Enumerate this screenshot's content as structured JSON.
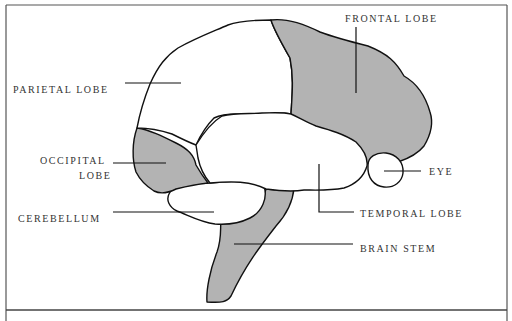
{
  "diagram": {
    "colors": {
      "highlight_fill": "#b3b3b3",
      "plain_fill": "#ffffff",
      "outline": "#111111",
      "frame": "#444444",
      "label": "#333333"
    },
    "labels": {
      "frontal_lobe": "FRONTAL LOBE",
      "parietal_lobe": "PARIETAL LOBE",
      "occipital_lobe_line1": "OCCIPITAL",
      "occipital_lobe_line2": "LOBE",
      "cerebellum": "CEREBELLUM",
      "eye": "EYE",
      "temporal_lobe": "TEMPORAL LOBE",
      "brain_stem": "BRAIN STEM"
    },
    "regions": [
      {
        "name": "frontal lobe",
        "shaded": true
      },
      {
        "name": "parietal lobe",
        "shaded": false
      },
      {
        "name": "occipital lobe",
        "shaded": true
      },
      {
        "name": "temporal lobe",
        "shaded": false
      },
      {
        "name": "cerebellum",
        "shaded": false
      },
      {
        "name": "brain stem",
        "shaded": true
      },
      {
        "name": "eye",
        "shaded": false
      }
    ]
  }
}
